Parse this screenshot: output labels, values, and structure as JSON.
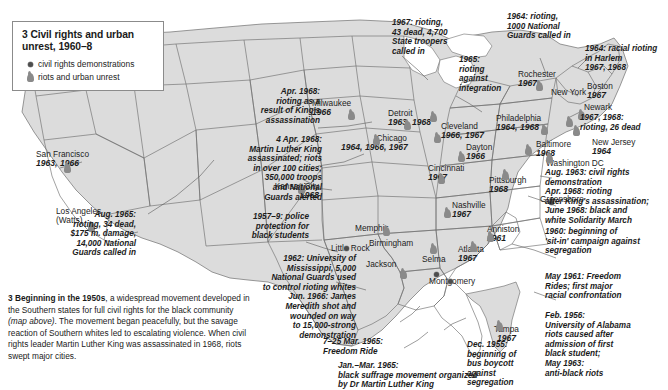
{
  "legend": {
    "title": "3 Civil rights and urban unrest, 1960–8",
    "items": [
      {
        "icon": "dot-marker-icon",
        "label": "civil rights demonstrations"
      },
      {
        "icon": "flame-marker-icon",
        "label": "riots and urban unrest"
      }
    ]
  },
  "cities": [
    {
      "name": "San Francisco",
      "years": "1963, 1966",
      "type": "riot"
    },
    {
      "name": "Los Angeles",
      "name2": "(Watts)",
      "years": "",
      "type": "riot"
    },
    {
      "name": "Milwaukee",
      "years": "1966",
      "type": "riot"
    },
    {
      "name": "Detroit",
      "years": "1963, 1968",
      "type": "riot"
    },
    {
      "name": "Cleveland",
      "years": "1966, 1967",
      "type": "riot"
    },
    {
      "name": "Chicago",
      "years": "1964, 1966, 1967",
      "type": "riot"
    },
    {
      "name": "Dayton",
      "years": "1966",
      "type": "riot"
    },
    {
      "name": "Cincinnati",
      "years": "1967",
      "type": "riot"
    },
    {
      "name": "Pittsburgh",
      "years": "1968",
      "type": "riot"
    },
    {
      "name": "Rochester",
      "years": "1967",
      "type": "riot"
    },
    {
      "name": "New York",
      "years": "",
      "type": "riot"
    },
    {
      "name": "Boston",
      "years": "1967",
      "type": "riot"
    },
    {
      "name": "Newark",
      "years": "",
      "type": "riot"
    },
    {
      "name": "Philadelphia",
      "years": "1964, 1968",
      "type": "riot"
    },
    {
      "name": "New Jersey",
      "years": "1964",
      "type": "riot"
    },
    {
      "name": "Baltimore",
      "years": "1968",
      "type": "riot"
    },
    {
      "name": "Washington DC",
      "years": "",
      "type": "riot"
    },
    {
      "name": "Greensboro",
      "years": "",
      "type": "demo"
    },
    {
      "name": "Kansas City",
      "years": "1968",
      "type": "riot"
    },
    {
      "name": "Little Rock",
      "years": "",
      "type": "demo"
    },
    {
      "name": "Memphis",
      "years": "",
      "type": "riot"
    },
    {
      "name": "Nashville",
      "years": "1967",
      "type": "riot"
    },
    {
      "name": "Anniston",
      "years": "1961",
      "type": "riot"
    },
    {
      "name": "Atlanta",
      "years": "1967",
      "type": "riot"
    },
    {
      "name": "Birmingham",
      "years": "",
      "type": "riot"
    },
    {
      "name": "Jackson",
      "years": "",
      "type": "riot"
    },
    {
      "name": "Selma",
      "years": "",
      "type": "demo"
    },
    {
      "name": "Montgomery",
      "years": "",
      "type": "demo"
    },
    {
      "name": "Tampa",
      "years": "1967",
      "type": "riot"
    }
  ],
  "annotations": [
    {
      "id": "los-angeles",
      "text": "Aug. 1965:\nrioting, 34 dead,\n$175 m. damage,\n14,000 National\nGuards called in"
    },
    {
      "id": "king-riots-west",
      "text": "Apr. 1968:\nrioting as a\nresult of King's\nassassination"
    },
    {
      "id": "king-assassination",
      "text": "4 Apr. 1968:\nMartin Luther King\nassassinated; riots\nin over 100 cities;\n350,000 troops\nand National\nGuards alerted"
    },
    {
      "id": "detroit-riot",
      "text": "1967: rioting,\n43 dead, 4,700\nState troopers\ncalled in"
    },
    {
      "id": "integration-riot",
      "text": "1965:\nrioting\nagainst\nintegration"
    },
    {
      "id": "rochester-riot",
      "text": "1964: rioting,\n1000 National\nGuards called in"
    },
    {
      "id": "harlem-riot",
      "text": "1964: racial rioting\nin Harlem\n1967, 1968"
    },
    {
      "id": "newark-riot",
      "text": "1967, 1968:\nrioting, 26 dead"
    },
    {
      "id": "washington-dc",
      "text": "Aug. 1963: civil rights\ndemonstration\nApr. 1968: rioting\nafter King's assassination;\nJune 1968: black and\nwhite Solidarity March"
    },
    {
      "id": "sit-in-campaign",
      "text": "1960: beginning of\n'sit-in' campaign against\nsegregation"
    },
    {
      "id": "freedom-rides",
      "text": "May 1961: Freedom\nRides; first major\nracial confrontation"
    },
    {
      "id": "alabama-university",
      "text": "Feb. 1956:\nUniversity of Alabama\nriots caused after\nadmission of first\nblack student;\nMay 1963:\nanti-black riots"
    },
    {
      "id": "little-rock",
      "text": "1957–9: police\nprotection for\nblack students"
    },
    {
      "id": "mississippi-university",
      "text": "1962: University of\nMississippi, 5,000\nNational Guards used\nto control rioting whites\nJun. 1966: James\nMeredith shot and\nwounded on way\nto 15,000-strong\ndemonstration"
    },
    {
      "id": "freedom-ride-march",
      "text": "7–25 Mar. 1965:\nFreedom Ride"
    },
    {
      "id": "black-suffrage",
      "text": "Jan.–Mar. 1965:\nblack suffrage movement organized\nby Dr Martin Luther King"
    },
    {
      "id": "bus-boycott",
      "text": "Dec. 1955:\nbeginning of\nbus boycott\nagainst\nsegregation"
    }
  ],
  "caption": {
    "number": "3",
    "lead": "Beginning in the 1950s",
    "body_1": ", a widespread movement developed in the Southern states for full civil rights for the black community ",
    "italic": "(map above)",
    "body_2": ". The movement began peacefully, but the savage reaction of Southern whites led to escalating violence. When civil rights leader Martin Luther King was assassinated in 1968, riots swept major cities."
  },
  "colors": {
    "land": "#d9d9d9",
    "land_light": "#e6e6e6",
    "border": "#6f6f6f",
    "marker_riot": "#8a8a8a",
    "marker_demo": "#4d4d4d",
    "text": "#1b1b1b",
    "leader": "#5a5a5a"
  }
}
